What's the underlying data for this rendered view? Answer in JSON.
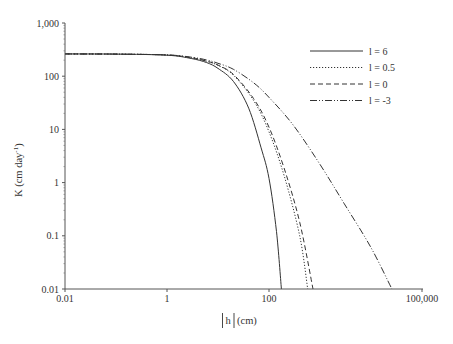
{
  "chart_data": {
    "type": "line",
    "title": "",
    "xlabel": "|h| (cm)",
    "ylabel": "K (cm day-1)",
    "xscale": "log",
    "yscale": "log",
    "xlim": [
      0.01,
      100000
    ],
    "ylim": [
      0.01,
      1000
    ],
    "x_ticks": [
      0.01,
      1,
      100,
      100000
    ],
    "x_tick_labels": [
      "0.01",
      "1",
      "100",
      "100,000"
    ],
    "y_ticks": [
      0.01,
      0.1,
      1,
      10,
      100,
      1000
    ],
    "y_tick_labels": [
      "0.01",
      "0.1",
      "1",
      "10",
      "100",
      "1,000"
    ],
    "grid": false,
    "legend_position": "upper right",
    "series": [
      {
        "name": "l = 6",
        "style": "solid",
        "points": [
          [
            0.01,
            262
          ],
          [
            0.1,
            260
          ],
          [
            1,
            248
          ],
          [
            3,
            215
          ],
          [
            6,
            180
          ],
          [
            10,
            140
          ],
          [
            20,
            80
          ],
          [
            40,
            25
          ],
          [
            70,
            4.5
          ],
          [
            100,
            1.2
          ],
          [
            140,
            0.12
          ],
          [
            175,
            0.01
          ]
        ]
      },
      {
        "name": "l = 0.5",
        "style": "dotted",
        "points": [
          [
            0.01,
            262
          ],
          [
            0.1,
            260
          ],
          [
            1,
            250
          ],
          [
            3,
            222
          ],
          [
            6,
            190
          ],
          [
            10,
            160
          ],
          [
            20,
            105
          ],
          [
            50,
            35
          ],
          [
            100,
            9
          ],
          [
            200,
            1.3
          ],
          [
            400,
            0.1
          ],
          [
            575,
            0.01
          ]
        ]
      },
      {
        "name": "l = 0",
        "style": "dashed",
        "points": [
          [
            0.01,
            262
          ],
          [
            0.1,
            260
          ],
          [
            1,
            250
          ],
          [
            3,
            223
          ],
          [
            6,
            192
          ],
          [
            10,
            162
          ],
          [
            20,
            108
          ],
          [
            50,
            38
          ],
          [
            100,
            11
          ],
          [
            200,
            1.8
          ],
          [
            400,
            0.18
          ],
          [
            730,
            0.01
          ]
        ]
      },
      {
        "name": "l = -3",
        "style": "dash-dot-dot",
        "points": [
          [
            0.01,
            262
          ],
          [
            0.1,
            260
          ],
          [
            1,
            251
          ],
          [
            3,
            228
          ],
          [
            6,
            202
          ],
          [
            10,
            175
          ],
          [
            20,
            135
          ],
          [
            50,
            75
          ],
          [
            100,
            40
          ],
          [
            300,
            12
          ],
          [
            1000,
            2.2
          ],
          [
            3000,
            0.4
          ],
          [
            10000,
            0.06
          ],
          [
            25700,
            0.01
          ]
        ]
      }
    ]
  },
  "axes": {
    "xlabel_h": "h",
    "xlabel_unit": "(cm)",
    "ylabel_main": "K (cm day",
    "ylabel_sup": "-1",
    "ylabel_close": ")"
  },
  "legend": [
    {
      "label": "l = 6",
      "style": "solid"
    },
    {
      "label": "l = 0.5",
      "style": "dotted"
    },
    {
      "label": "l = 0",
      "style": "dashed"
    },
    {
      "label": "l = -3",
      "style": "dash-dot-dot"
    }
  ],
  "colors": {
    "line": "#333333",
    "axis": "#555555",
    "background": "#ffffff"
  }
}
